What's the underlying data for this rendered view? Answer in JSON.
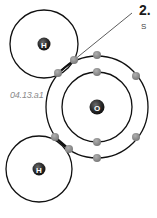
{
  "figure": {
    "id_label": "04.13.a1",
    "step_number": "2.",
    "step_text": "S"
  },
  "colors": {
    "orbit": "#111111",
    "nucleus": "#2b2b2b",
    "electron": "#8c8c8c",
    "nucleus_label": "#ffffff"
  },
  "atoms": [
    {
      "name": "hydrogen-top",
      "symbol": "H",
      "cx": 44,
      "cy": 44,
      "orbits": [
        34
      ]
    },
    {
      "name": "oxygen",
      "symbol": "O",
      "cx": 97,
      "cy": 107,
      "orbits": [
        35,
        51
      ]
    },
    {
      "name": "hydrogen-bottom",
      "symbol": "H",
      "cx": 39,
      "cy": 169,
      "orbits": [
        33
      ]
    }
  ],
  "electrons": [
    {
      "x": 74,
      "y": 60
    },
    {
      "x": 58,
      "y": 73
    },
    {
      "x": 97,
      "y": 55
    },
    {
      "x": 97,
      "y": 72
    },
    {
      "x": 136,
      "y": 76
    },
    {
      "x": 55,
      "y": 137
    },
    {
      "x": 69,
      "y": 149
    },
    {
      "x": 97,
      "y": 142
    },
    {
      "x": 97,
      "y": 158
    },
    {
      "x": 136,
      "y": 137
    }
  ]
}
